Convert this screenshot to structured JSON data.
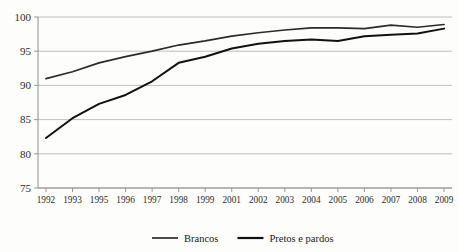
{
  "title_partial": "",
  "chart_data": {
    "type": "line",
    "title": "",
    "subtitle": "",
    "xlabel": "",
    "ylabel": "",
    "categories": [
      "1992",
      "1993",
      "1995",
      "1996",
      "1997",
      "1998",
      "1999",
      "2001",
      "2002",
      "2003",
      "2004",
      "2005",
      "2006",
      "2007",
      "2008",
      "2009"
    ],
    "x": [
      "1992",
      "1993",
      "1995",
      "1996",
      "1997",
      "1998",
      "1999",
      "2001",
      "2002",
      "2003",
      "2004",
      "2005",
      "2006",
      "2007",
      "2008",
      "2009"
    ],
    "ylim": [
      75,
      100
    ],
    "yticks": [
      75,
      80,
      85,
      90,
      95,
      100
    ],
    "xlim_note": "categorical, evenly spaced",
    "grid": "horizontal",
    "legend_position": "bottom-center",
    "series": [
      {
        "name": "Brancos",
        "color": "#2b2b2b",
        "stroke_width": 1.7,
        "values": [
          91.0,
          92.0,
          93.3,
          94.2,
          95.0,
          95.9,
          96.5,
          97.2,
          97.7,
          98.1,
          98.4,
          98.4,
          98.3,
          98.8,
          98.5,
          98.9
        ]
      },
      {
        "name": "Pretos e pardos",
        "color": "#111111",
        "stroke_width": 2.0,
        "values": [
          82.3,
          85.2,
          87.3,
          88.6,
          90.6,
          93.3,
          94.2,
          95.4,
          96.1,
          96.5,
          96.7,
          96.5,
          97.2,
          97.4,
          97.6,
          98.3
        ]
      }
    ]
  },
  "axis": {
    "y_tick_labels": [
      "100",
      "95",
      "90",
      "85",
      "80",
      "75"
    ],
    "x_tick_labels": [
      "1992",
      "1993",
      "1995",
      "1996",
      "1997",
      "1998",
      "1999",
      "2001",
      "2002",
      "2003",
      "2004",
      "2005",
      "2006",
      "2007",
      "2008",
      "2009"
    ]
  },
  "legend": {
    "items": [
      {
        "label": "Brancos",
        "color": "#2b2b2b",
        "stroke_width": 1.7
      },
      {
        "label": "Pretos e pardos",
        "color": "#111111",
        "stroke_width": 2.2
      }
    ]
  }
}
